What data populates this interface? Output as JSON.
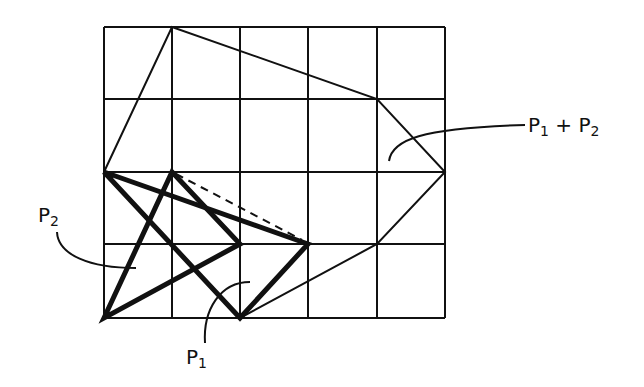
{
  "diagram": {
    "colors": {
      "ink": "#111111",
      "background": "#ffffff"
    },
    "grid": {
      "columns": 5,
      "rows": 4,
      "x_lines": [
        104,
        172,
        240,
        308,
        377,
        445
      ],
      "y_lines": [
        27,
        99,
        172,
        244,
        318
      ]
    },
    "polygons": [
      {
        "name": "P1",
        "style": "thick",
        "points": [
          [
            104,
            172
          ],
          [
            308,
            244
          ],
          [
            240,
            318
          ]
        ]
      },
      {
        "name": "P2",
        "style": "thick",
        "points": [
          [
            104,
            318
          ],
          [
            172,
            172
          ],
          [
            240,
            244
          ]
        ]
      },
      {
        "name": "P1+P2",
        "style": "thin",
        "points": [
          [
            104,
            172
          ],
          [
            172,
            27
          ],
          [
            377,
            99
          ],
          [
            445,
            172
          ],
          [
            377,
            244
          ],
          [
            240,
            318
          ],
          [
            104,
            318
          ]
        ]
      }
    ],
    "dashed_segment": {
      "from": [
        172,
        172
      ],
      "to": [
        308,
        244
      ]
    },
    "labels": {
      "p1": {
        "base": "P",
        "sub": "1"
      },
      "p2": {
        "base": "P",
        "sub": "2"
      },
      "sum": {
        "base1": "P",
        "sub1": "1",
        "op": "+",
        "base2": "P",
        "sub2": "2"
      }
    }
  }
}
